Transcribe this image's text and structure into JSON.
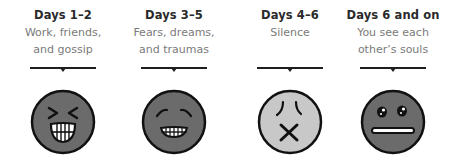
{
  "stages": [
    {
      "title": "Days 1–2",
      "description": "Work, friends,\nand gossip",
      "face": {
        "icon": "laughing-face-icon",
        "fill": "#6b6b6b"
      }
    },
    {
      "title": "Days 3–5",
      "description": "Fears, dreams,\nand traumas",
      "face": {
        "icon": "relieved-grin-face-icon",
        "fill": "#6b6b6b"
      }
    },
    {
      "title": "Days 4–6",
      "description": "Silence",
      "face": {
        "icon": "dizzy-silent-face-icon",
        "fill": "#c8c8c8"
      }
    },
    {
      "title": "Days 6 and on",
      "description": "You see each\nother’s souls",
      "face": {
        "icon": "neutral-staring-face-icon",
        "fill": "#6b6b6b"
      }
    }
  ],
  "colors": {
    "title": "#2a2a2a",
    "description": "#7a7a7a",
    "line": "#1f1f1f",
    "face_outline": "#111111",
    "dark_face": "#6b6b6b",
    "light_face": "#c8c8c8"
  }
}
